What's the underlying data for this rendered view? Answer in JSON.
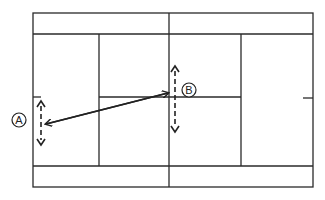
{
  "diagram": {
    "type": "tennis-court-top-view",
    "colors": {
      "line": "#2a2a2a",
      "background": "#ffffff"
    },
    "players": [
      {
        "id": "A",
        "label": "A",
        "movement": "vertical-dashed-arrow",
        "position": "behind left baseline"
      },
      {
        "id": "B",
        "label": "B",
        "movement": "vertical-dashed-arrow",
        "position": "at net, center"
      }
    ],
    "shot": {
      "from": "B",
      "to": "A",
      "style": "solid-arrow"
    }
  }
}
